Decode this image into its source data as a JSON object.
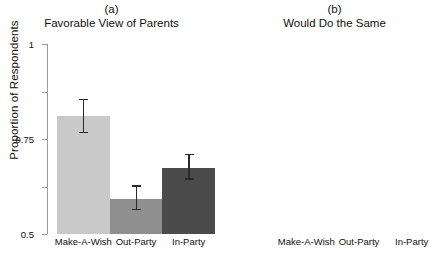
{
  "chart_data": {
    "type": "bar",
    "title": "",
    "xlabel": "",
    "ylabel": "Proportion of Respondents",
    "ylim": [
      0,
      1
    ],
    "yticks": [
      0,
      0.25,
      0.5,
      0.75,
      1
    ],
    "ytick_labels": [
      "0",
      "0.25",
      "0.5",
      "0.75",
      "1"
    ],
    "grid": false,
    "legend": "none",
    "categories": [
      "Make-A-Wish",
      "Out-Party",
      "In-Party"
    ],
    "bar_colors": [
      "#c9c9c9",
      "#8f8f8f",
      "#4b4b4b"
    ],
    "error_bar_color": "#2a2a2a",
    "panels": [
      {
        "tag": "(a)",
        "title": "Favorable View of Parents",
        "categories": [
          "Make-A-Wish",
          "Out-Party",
          "In-Party"
        ],
        "values": [
          0.62,
          0.185,
          0.35
        ],
        "err_low": [
          0.53,
          0.125,
          0.285
        ],
        "err_high": [
          0.705,
          0.25,
          0.415
        ]
      },
      {
        "tag": "(b)",
        "title": "Would Do the Same",
        "categories": [
          "Make-A-Wish",
          "Out-Party",
          "In-Party"
        ],
        "values": [
          0.37,
          0.17,
          0.195
        ],
        "err_low": [
          0.285,
          0.115,
          0.135
        ],
        "err_high": [
          0.46,
          0.235,
          0.27
        ]
      }
    ]
  }
}
